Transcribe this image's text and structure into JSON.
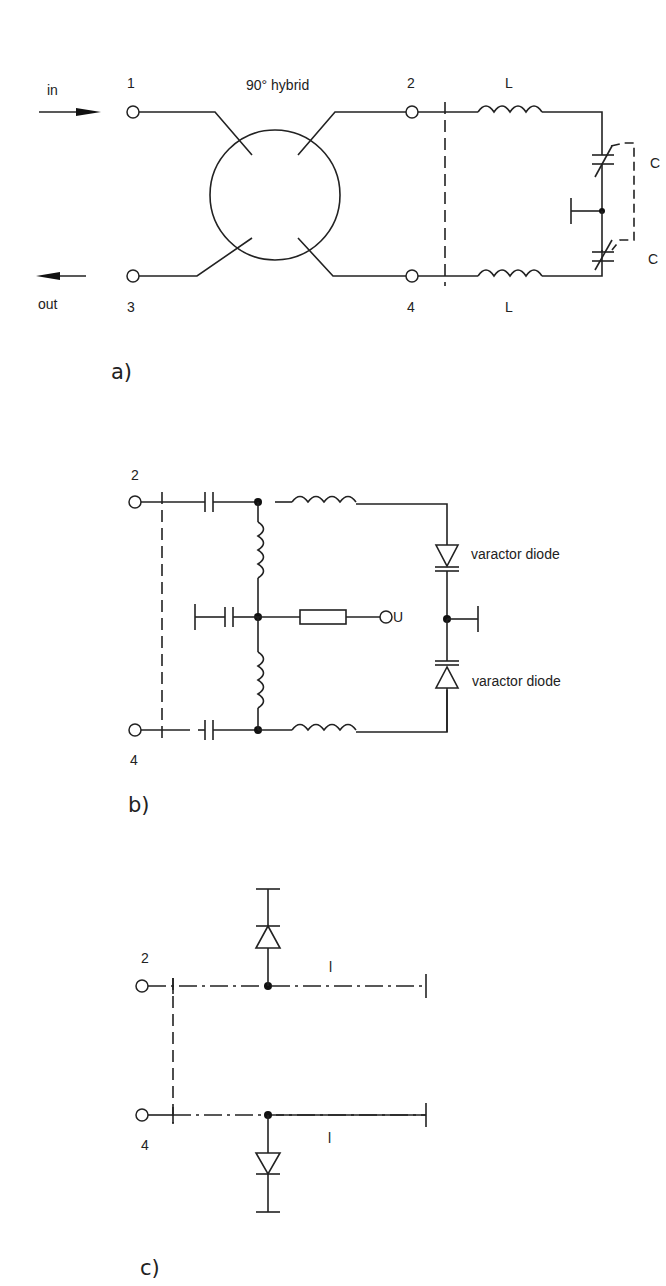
{
  "figure": {
    "panels": [
      {
        "id": "a",
        "label": "a)"
      },
      {
        "id": "b",
        "label": "b)"
      },
      {
        "id": "c",
        "label": "c)"
      }
    ]
  },
  "panel_a": {
    "in_label": "in",
    "out_label": "out",
    "hybrid_label": "90° hybrid",
    "port1": "1",
    "port2": "2",
    "port3": "3",
    "port4": "4",
    "inductor_top": "L",
    "inductor_bottom": "L",
    "cap_top": "C",
    "cap_bottom": "C",
    "panel_label": "a)"
  },
  "panel_b": {
    "port_top": "2",
    "port_bottom": "4",
    "bias_terminal": "U",
    "diode_top": "varactor diode",
    "diode_bottom": "varactor diode",
    "panel_label": "b)"
  },
  "panel_c": {
    "port_top": "2",
    "port_bottom": "4",
    "line_top": "l",
    "line_bottom": "l",
    "panel_label": "c)"
  }
}
